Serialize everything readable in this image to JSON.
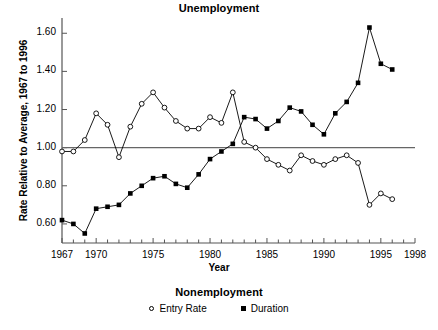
{
  "chart_title": "Unemployment",
  "axes": {
    "x_label": "Year",
    "y_label": "Rate Relative to Average, 1967 to 1996",
    "x_ticks": [
      "1967",
      "1970",
      "1975",
      "1980",
      "1985",
      "1990",
      "1995",
      "1998"
    ],
    "y_ticks": [
      "0.60",
      "0.80",
      "1.00",
      "1.20",
      "1.40",
      "1.60"
    ]
  },
  "legend": {
    "title": "Nonemployment",
    "entries": [
      {
        "label": "Entry Rate",
        "marker": "open-circle"
      },
      {
        "label": "Duration",
        "marker": "filled-square"
      }
    ]
  },
  "chart_data": {
    "type": "line",
    "title": "Unemployment",
    "xlabel": "Year",
    "ylabel": "Rate Relative to Average, 1967 to 1996",
    "xlim": [
      1967,
      1998
    ],
    "ylim": [
      0.5,
      1.68
    ],
    "xticks": [
      1967,
      1970,
      1975,
      1980,
      1985,
      1990,
      1995,
      1998
    ],
    "yticks": [
      0.6,
      0.8,
      1.0,
      1.2,
      1.4,
      1.6
    ],
    "grid": false,
    "legend_position": "bottom",
    "reference_line": 1.0,
    "x": [
      1967,
      1968,
      1969,
      1970,
      1971,
      1972,
      1973,
      1974,
      1975,
      1976,
      1977,
      1978,
      1979,
      1980,
      1981,
      1982,
      1983,
      1984,
      1985,
      1986,
      1987,
      1988,
      1989,
      1990,
      1991,
      1992,
      1993,
      1994,
      1995,
      1996
    ],
    "series": [
      {
        "name": "Entry Rate",
        "marker": "open-circle",
        "values": [
          0.98,
          0.98,
          1.04,
          1.18,
          1.12,
          0.95,
          1.11,
          1.23,
          1.29,
          1.21,
          1.14,
          1.1,
          1.1,
          1.16,
          1.13,
          1.29,
          1.03,
          1.0,
          0.94,
          0.91,
          0.88,
          0.96,
          0.93,
          0.91,
          0.94,
          0.96,
          0.92,
          0.7,
          0.76,
          0.73
        ]
      },
      {
        "name": "Duration",
        "marker": "filled-square",
        "values": [
          0.62,
          0.6,
          0.55,
          0.68,
          0.69,
          0.7,
          0.76,
          0.8,
          0.84,
          0.85,
          0.81,
          0.79,
          0.86,
          0.94,
          0.98,
          1.02,
          1.16,
          1.15,
          1.1,
          1.14,
          1.21,
          1.19,
          1.12,
          1.07,
          1.18,
          1.24,
          1.34,
          1.63,
          1.44,
          1.41
        ]
      }
    ]
  }
}
